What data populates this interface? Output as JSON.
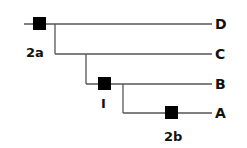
{
  "diagram": {
    "type": "cladogram",
    "taxa": [
      {
        "id": "D",
        "label": "D",
        "y": 24
      },
      {
        "id": "C",
        "label": "C",
        "y": 54
      },
      {
        "id": "B",
        "label": "B",
        "y": 84
      },
      {
        "id": "A",
        "label": "A",
        "y": 113
      }
    ],
    "events": [
      {
        "id": "2a",
        "label": "2a"
      },
      {
        "id": "1",
        "label": "I"
      },
      {
        "id": "2b",
        "label": "2b"
      }
    ],
    "colors": {
      "line": "#555555",
      "marker": "#000000",
      "text": "#111111",
      "background": "#ffffff"
    }
  }
}
